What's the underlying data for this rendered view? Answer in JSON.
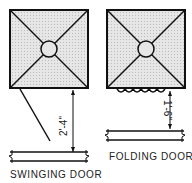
{
  "diagrams": [
    {
      "id": "swinging",
      "label": "SWINGING DOOR",
      "dimension": "2'-4\""
    },
    {
      "id": "folding",
      "label": "FOLDING DOOR",
      "dimension": "1'-6\""
    }
  ],
  "colors": {
    "line": "#111111",
    "fill": "#d9d9d9"
  }
}
